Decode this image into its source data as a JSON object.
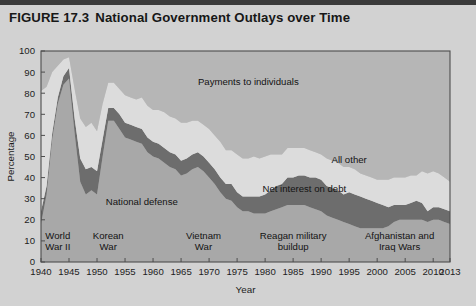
{
  "figure": {
    "number": "FIGURE 17.3",
    "title": "National Government Outlays over Time"
  },
  "chart_data": {
    "type": "area",
    "title": "National Government Outlays over Time",
    "xlabel": "Year",
    "ylabel": "Percentage",
    "xlim": [
      1940,
      2013
    ],
    "ylim": [
      0,
      100
    ],
    "grid": false,
    "legend_position": "inline-annotations",
    "stacked": true,
    "x": [
      1940,
      1941,
      1942,
      1943,
      1944,
      1945,
      1946,
      1947,
      1948,
      1949,
      1950,
      1951,
      1952,
      1953,
      1954,
      1955,
      1956,
      1957,
      1958,
      1959,
      1960,
      1961,
      1962,
      1963,
      1964,
      1965,
      1966,
      1967,
      1968,
      1969,
      1970,
      1971,
      1972,
      1973,
      1974,
      1975,
      1976,
      1977,
      1978,
      1979,
      1980,
      1981,
      1982,
      1983,
      1984,
      1985,
      1986,
      1987,
      1988,
      1989,
      1990,
      1991,
      1992,
      1993,
      1994,
      1995,
      1996,
      1997,
      1998,
      1999,
      2000,
      2001,
      2002,
      2003,
      2004,
      2005,
      2006,
      2007,
      2008,
      2009,
      2010,
      2011,
      2012,
      2013
    ],
    "series": [
      {
        "name": "National defense",
        "color": "#a8a8a8",
        "values": [
          18,
          32,
          58,
          75,
          84,
          87,
          61,
          38,
          32,
          34,
          32,
          50,
          67,
          67,
          63,
          59,
          58,
          57,
          56,
          52,
          50,
          49,
          47,
          45,
          44,
          41,
          42,
          44,
          45,
          43,
          40,
          37,
          33,
          30,
          29,
          26,
          24,
          24,
          23,
          23,
          23,
          24,
          25,
          26,
          27,
          27,
          27,
          27,
          26,
          25,
          24,
          22,
          21,
          20,
          19,
          18,
          17,
          16,
          16,
          16,
          16,
          16,
          17,
          19,
          20,
          20,
          20,
          20,
          20,
          19,
          20,
          20,
          19,
          18
        ]
      },
      {
        "name": "Net interest on debt",
        "color": "#6d6d6d",
        "values": [
          6,
          4,
          3,
          3,
          4,
          5,
          7,
          11,
          12,
          11,
          11,
          8,
          6,
          6,
          7,
          7,
          7,
          7,
          7,
          7,
          7,
          7,
          7,
          7,
          7,
          7,
          7,
          7,
          7,
          7,
          7,
          7,
          7,
          7,
          8,
          7,
          7,
          7,
          8,
          8,
          9,
          10,
          11,
          11,
          13,
          13,
          14,
          14,
          14,
          15,
          15,
          14,
          14,
          14,
          13,
          15,
          15,
          15,
          14,
          13,
          12,
          11,
          9,
          8,
          7,
          7,
          8,
          9,
          8,
          5,
          6,
          6,
          6,
          6
        ]
      },
      {
        "name": "All other",
        "color": "#dcdcdc",
        "values": [
          57,
          47,
          29,
          15,
          8,
          5,
          14,
          19,
          20,
          21,
          19,
          17,
          12,
          12,
          12,
          13,
          13,
          13,
          15,
          15,
          15,
          16,
          17,
          17,
          17,
          18,
          17,
          16,
          15,
          15,
          16,
          16,
          17,
          16,
          16,
          18,
          18,
          18,
          19,
          18,
          18,
          17,
          15,
          14,
          14,
          14,
          13,
          13,
          13,
          12,
          12,
          13,
          13,
          13,
          13,
          12,
          12,
          11,
          11,
          11,
          11,
          12,
          13,
          13,
          13,
          13,
          13,
          12,
          15,
          18,
          17,
          16,
          15,
          14
        ]
      },
      {
        "name": "Payments to individuals",
        "color": "#b6b6b6",
        "values": [
          19,
          17,
          10,
          7,
          4,
          3,
          18,
          32,
          36,
          34,
          38,
          25,
          15,
          15,
          18,
          21,
          22,
          23,
          22,
          26,
          28,
          28,
          29,
          31,
          32,
          34,
          34,
          33,
          33,
          35,
          37,
          40,
          43,
          47,
          47,
          49,
          51,
          51,
          50,
          51,
          50,
          49,
          49,
          49,
          46,
          46,
          46,
          46,
          47,
          48,
          49,
          51,
          52,
          53,
          55,
          55,
          56,
          58,
          59,
          60,
          61,
          61,
          61,
          60,
          60,
          60,
          59,
          59,
          57,
          58,
          57,
          58,
          60,
          62
        ]
      }
    ],
    "y_ticks": [
      0,
      10,
      20,
      30,
      40,
      50,
      60,
      70,
      80,
      90,
      100
    ],
    "x_ticks": [
      1940,
      1945,
      1950,
      1955,
      1960,
      1965,
      1970,
      1975,
      1980,
      1985,
      1990,
      1995,
      2000,
      2005,
      2010,
      2013
    ],
    "annotations": [
      {
        "id": "payments-to-individuals",
        "text": "Payments to individuals",
        "x": 1977,
        "y": 84
      },
      {
        "id": "all-other",
        "text": "All other",
        "x": 1995,
        "y": 47
      },
      {
        "id": "net-interest-on-debt",
        "text": "Net interest on debt",
        "x": 1987,
        "y": 33
      },
      {
        "id": "national-defense",
        "text": "National defense",
        "x": 1958,
        "y": 27
      },
      {
        "id": "world-war-ii",
        "line1": "World",
        "line2": "War II",
        "x": 1943,
        "y": 11
      },
      {
        "id": "korean-war",
        "line1": "Korean",
        "line2": "War",
        "x": 1952,
        "y": 11
      },
      {
        "id": "vietnam-war",
        "line1": "Vietnam",
        "line2": "War",
        "x": 1969,
        "y": 11
      },
      {
        "id": "reagan-military-buildup",
        "line1": "Reagan military",
        "line2": "buildup",
        "x": 1985,
        "y": 11
      },
      {
        "id": "afghanistan-and-iraq-wars",
        "line1": "Afghanistan and",
        "line2": "Iraq Wars",
        "x": 2004,
        "y": 11
      }
    ]
  },
  "colors": {
    "figure_background": "#d2d2d2",
    "plot_background": "#c9c9c9",
    "defense": "#a8a8a8",
    "net_interest": "#6d6d6d",
    "all_other": "#dcdcdc",
    "payments": "#b6b6b6",
    "frame": "#4d4d4d",
    "text": "#1d1d1d"
  }
}
